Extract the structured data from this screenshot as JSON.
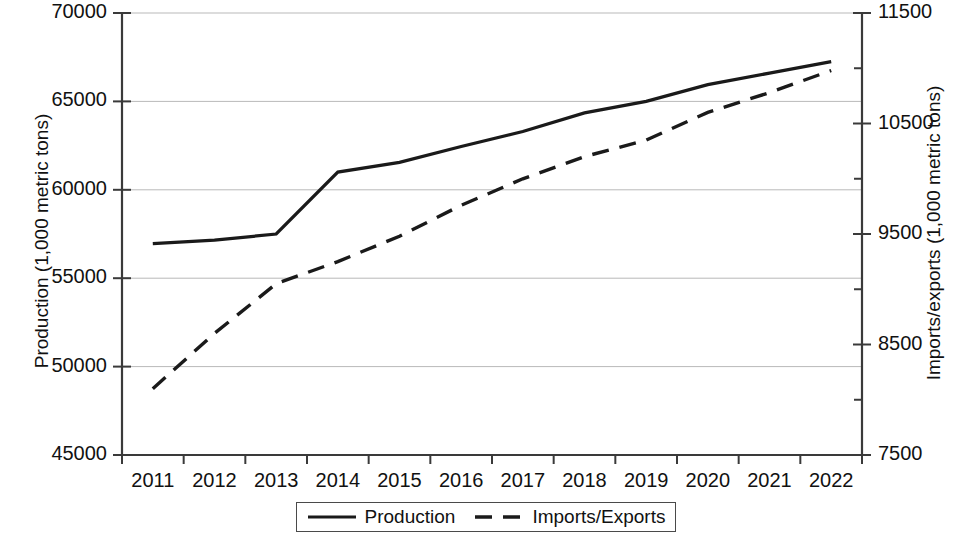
{
  "chart_data": {
    "type": "line",
    "title": "",
    "subtitle": "",
    "xlabel": "",
    "categories": [
      "2011",
      "2012",
      "2013",
      "2014",
      "2015",
      "2016",
      "2017",
      "2018",
      "2019",
      "2020",
      "2021",
      "2022"
    ],
    "grid": true,
    "legend_position": "bottom",
    "axes": {
      "left": {
        "label": "Production (1,000 metric tons)",
        "ticks": [
          45000,
          50000,
          55000,
          60000,
          65000,
          70000
        ],
        "tick_labels": [
          "45000",
          "50000",
          "55000",
          "60000",
          "65000",
          "70000"
        ],
        "min": 45000,
        "max": 70000
      },
      "right": {
        "label": "Imports/exports (1,000 metric tons)",
        "ticks": [
          7500,
          8500,
          9500,
          10500,
          11500
        ],
        "tick_labels": [
          "7500",
          "8500",
          "9500",
          "10500",
          "11500"
        ],
        "minor_ticks": [
          8000,
          9000,
          10000,
          11000
        ],
        "min": 7500,
        "max": 11500
      }
    },
    "series": [
      {
        "name": "Production",
        "axis": "left",
        "style": "solid",
        "color": "#1a1a1a",
        "values": [
          56950,
          57150,
          57500,
          61000,
          61550,
          62450,
          63300,
          64350,
          65000,
          65950,
          66600,
          67250
        ]
      },
      {
        "name": "Imports/Exports",
        "axis": "right",
        "style": "dashed",
        "color": "#1a1a1a",
        "values": [
          8100,
          8600,
          9050,
          9250,
          9480,
          9760,
          10000,
          10200,
          10350,
          10600,
          10780,
          10980
        ]
      }
    ]
  },
  "legend": {
    "items": [
      {
        "label": "Production",
        "style": "solid"
      },
      {
        "label": "Imports/Exports",
        "style": "dashed"
      }
    ]
  }
}
